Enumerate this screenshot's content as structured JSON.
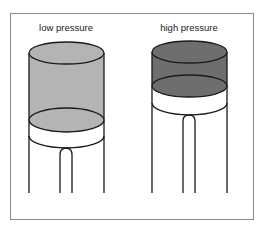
{
  "diagram": {
    "panels": [
      {
        "label": "low pressure",
        "gas_color": "#b4b4b4",
        "gas_state": "expanded",
        "piston_position": "low"
      },
      {
        "label": "high pressure",
        "gas_color": "#6e6e6e",
        "gas_state": "compressed",
        "piston_position": "high"
      }
    ],
    "colors": {
      "outline": "#1a1a1a",
      "frame": "#8a8a8a",
      "piston": "#ffffff"
    }
  }
}
